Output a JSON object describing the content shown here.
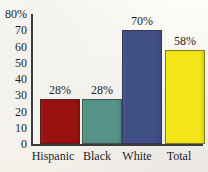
{
  "chart_data": {
    "type": "bar",
    "title": "",
    "title_note": "title cropped off at top edge of image",
    "categories": [
      "Hispanic",
      "Black",
      "White",
      "Total"
    ],
    "values": [
      28,
      28,
      70,
      58
    ],
    "value_labels": [
      "28%",
      "28%",
      "70%",
      "58%"
    ],
    "xlabel": "",
    "ylabel": "",
    "ylim": [
      0,
      80
    ],
    "y_ticks": [
      0,
      10,
      20,
      30,
      40,
      50,
      60,
      70,
      80
    ],
    "y_tick_labels": [
      "0",
      "10",
      "20",
      "30",
      "40",
      "50",
      "60",
      "70",
      "80%"
    ],
    "grid": false,
    "legend": false,
    "bar_colors": [
      "#991111",
      "#569287",
      "#414f87",
      "#f2e616"
    ],
    "axis_color": "#3b3b3b",
    "background": "#fbfaf6"
  },
  "axis": {
    "y_ticks": [
      {
        "label": "80%",
        "value": 80
      },
      {
        "label": "70",
        "value": 70
      },
      {
        "label": "60",
        "value": 60
      },
      {
        "label": "50",
        "value": 50
      },
      {
        "label": "40",
        "value": 40
      },
      {
        "label": "30",
        "value": 30
      },
      {
        "label": "20",
        "value": 20
      },
      {
        "label": "10",
        "value": 10
      },
      {
        "label": "0",
        "value": 0
      }
    ]
  },
  "bars": [
    {
      "category": "Hispanic",
      "value": 28,
      "label": "28%",
      "color": "#991111"
    },
    {
      "category": "Black",
      "value": 28,
      "label": "28%",
      "color": "#569287"
    },
    {
      "category": "White",
      "value": 70,
      "label": "70%",
      "color": "#414f87"
    },
    {
      "category": "Total",
      "value": 58,
      "label": "58%",
      "color": "#f2e616"
    }
  ]
}
